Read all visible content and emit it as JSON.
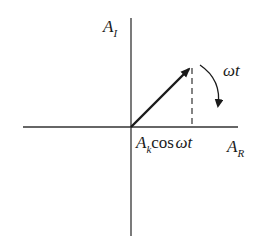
{
  "diagram": {
    "axes": {
      "vertical_label": {
        "main": "A",
        "sub": "I"
      },
      "horizontal_label": {
        "main": "A",
        "sub": "R"
      }
    },
    "phasor": {
      "from": [
        131,
        127
      ],
      "to": [
        192,
        66
      ]
    },
    "projection_label": {
      "main": "A",
      "sub": "k",
      "func": "cos",
      "arg": "ωt"
    },
    "rotation_label": "ωt",
    "colors": {
      "line": "#1a1a1a",
      "axis": "#333333",
      "background": "#ffffff"
    }
  }
}
